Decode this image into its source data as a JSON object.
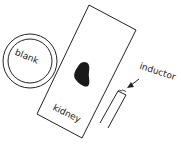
{
  "diagram": {
    "labels": {
      "blank": "blank",
      "kidney": "kidney",
      "inductor": "inductor"
    },
    "elements": [
      {
        "name": "blank-disc",
        "shape": "double-circle"
      },
      {
        "name": "kidney-slide",
        "shape": "tilted-rectangle"
      },
      {
        "name": "kidney-tissue",
        "shape": "dark-blob"
      },
      {
        "name": "inductor",
        "shape": "hairpin-wire"
      }
    ],
    "colors": {
      "stroke": "#222222",
      "fill": "#1a1a1a",
      "background": "#ffffff"
    }
  }
}
